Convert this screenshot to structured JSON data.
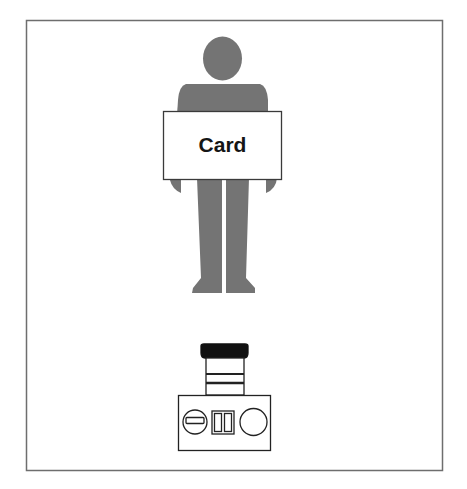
{
  "diagram": {
    "card": {
      "label": "Card"
    },
    "elements": [
      "person-silhouette",
      "card",
      "camera"
    ],
    "colors": {
      "frame": "#6e6e6e",
      "figure": "#747474",
      "card_fill": "#ffffff",
      "outline": "#333333",
      "lens_cap": "#111111"
    }
  }
}
